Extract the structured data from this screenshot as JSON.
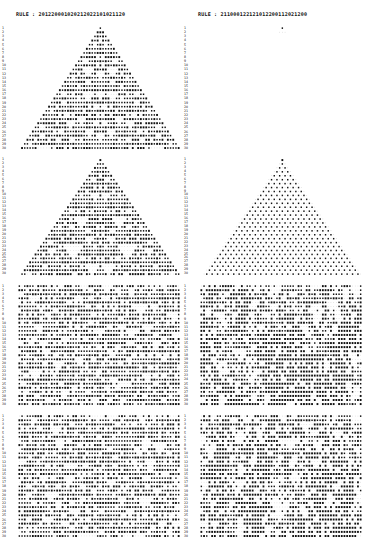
{
  "figure": {
    "left_rule_label": "RULE : 201220001020212022101021120",
    "right_rule_label": "RULE : 211000122121012200112021200",
    "rows_per_panel": 30,
    "panels": [
      {
        "id": "top-left",
        "rule": "left",
        "init": "single",
        "x": 18,
        "y": 26,
        "w": 162,
        "h": 124
      },
      {
        "id": "top-right",
        "rule": "right",
        "init": "dies",
        "x": 200,
        "y": 26,
        "w": 162,
        "h": 124
      },
      {
        "id": "mid-left",
        "rule": "left",
        "init": "single2",
        "x": 18,
        "y": 158,
        "w": 162,
        "h": 118
      },
      {
        "id": "mid-right",
        "rule": "right",
        "init": "single2",
        "x": 200,
        "y": 158,
        "w": 162,
        "h": 118
      },
      {
        "id": "lower-left",
        "rule": "left",
        "init": "random",
        "x": 18,
        "y": 284,
        "w": 162,
        "h": 122
      },
      {
        "id": "lower-right",
        "rule": "right",
        "init": "random",
        "x": 200,
        "y": 284,
        "w": 162,
        "h": 122
      },
      {
        "id": "bottom-left",
        "rule": "left",
        "init": "random2",
        "x": 18,
        "y": 414,
        "w": 162,
        "h": 124
      },
      {
        "id": "bottom-right",
        "rule": "right",
        "init": "random2",
        "x": 200,
        "y": 414,
        "w": 162,
        "h": 124
      }
    ]
  }
}
